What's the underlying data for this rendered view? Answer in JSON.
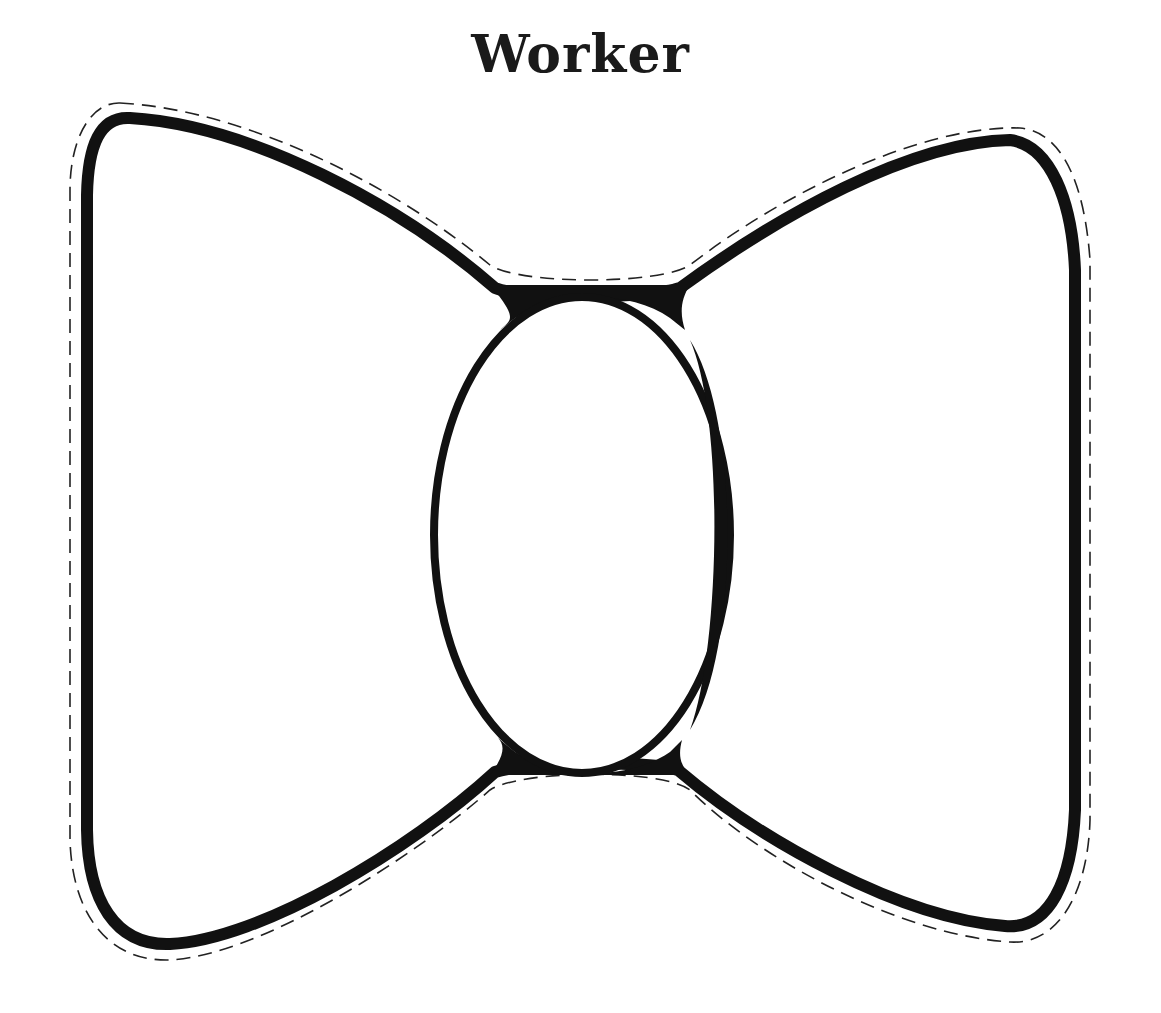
{
  "title": "Worker",
  "pattern": {
    "shape": "bow-tie",
    "outline_color": "#111111",
    "cut_line_color": "#222222",
    "cut_line_style": "dashed",
    "background": "#ffffff"
  }
}
